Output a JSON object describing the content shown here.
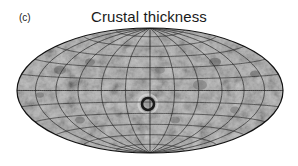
{
  "figure": {
    "panel_label": "(c)",
    "title": "Crustal thickness"
  },
  "map": {
    "projection": "hammer",
    "center_x": 150,
    "center_y": 90.5,
    "half_width": 133,
    "half_height": 62.5,
    "meridian_step_deg": 30,
    "parallel_step_deg": 15,
    "fill_color": "#8c8c8c",
    "grid_color": "#1e1e1e",
    "outline_color": "#111111",
    "features": [
      {
        "name": "central-basin",
        "x": 148,
        "y": 104,
        "r": 6,
        "kind": "ring"
      }
    ]
  }
}
